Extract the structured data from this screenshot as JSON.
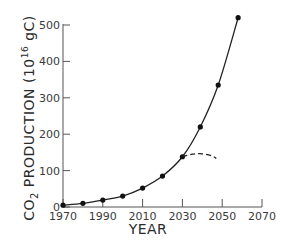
{
  "chart_data": {
    "type": "line",
    "title": "",
    "xlabel": "YEAR",
    "ylabel": "CO2 PRODUCTION (10^16 gC)",
    "ylabel_parts": {
      "main": "CO",
      "sub": "2",
      "rest": " PRODUCTION  (10",
      "sup": "16",
      "unit": " gC)"
    },
    "xlim": [
      1970,
      2070
    ],
    "ylim": [
      0,
      500
    ],
    "x_ticks": [
      1970,
      1990,
      2010,
      2030,
      2050,
      2070
    ],
    "x_minor_ticks": [
      1970,
      1990,
      2010,
      2030,
      2050,
      2070
    ],
    "y_ticks": [
      0,
      100,
      200,
      300,
      400,
      500
    ],
    "grid": false,
    "legend": null,
    "series": [
      {
        "name": "CO2 production (exponential growth)",
        "style": "solid line with markers",
        "x": [
          1970,
          1980,
          1990,
          2000,
          2010,
          2020,
          2030,
          2039,
          2048,
          2058
        ],
        "values": [
          5,
          10,
          19,
          30,
          52,
          85,
          138,
          220,
          335,
          520
        ]
      },
      {
        "name": "Alternative projection",
        "style": "dashed line",
        "x": [
          2030,
          2035,
          2040,
          2045,
          2047
        ],
        "values": [
          138,
          145,
          146,
          140,
          133
        ]
      }
    ]
  }
}
